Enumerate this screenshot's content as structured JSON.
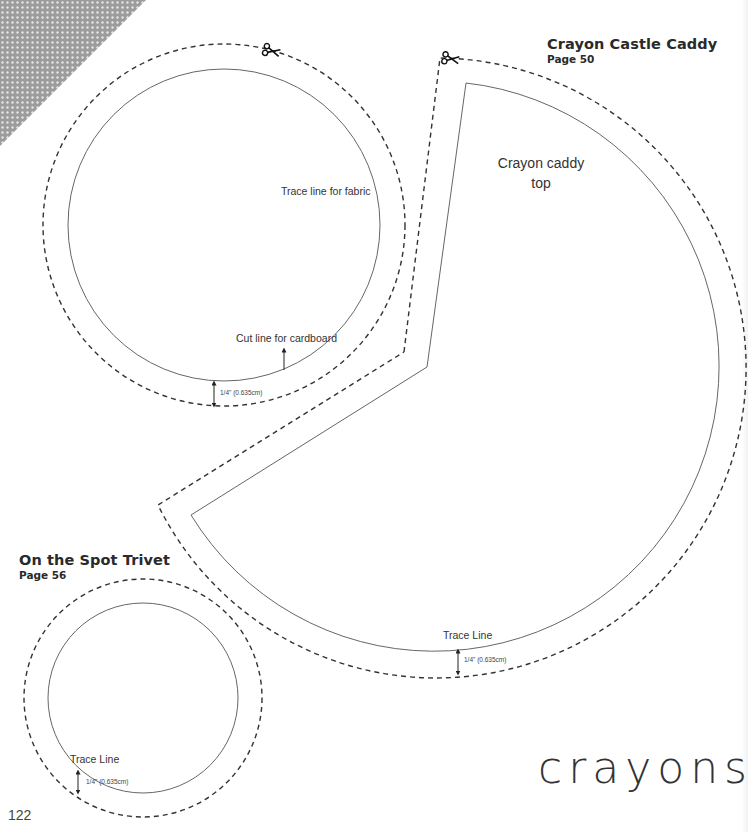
{
  "headings": {
    "caddy_title": "Crayon Castle Caddy",
    "caddy_page": "Page 50",
    "trivet_title": "On the Spot Trivet",
    "trivet_page": "Page 56"
  },
  "labels": {
    "trace_fabric": "Trace line for fabric",
    "cut_cardboard": "Cut line for cardboard",
    "caddy_top_line1": "Crayon caddy",
    "caddy_top_line2": "top",
    "trace_line_caddy": "Trace Line",
    "trace_line_trivet": "Trace Line"
  },
  "measurements": {
    "seam_circle": "1/4\" (0.635cm)",
    "seam_caddy": "1/4\" (0.635cm)",
    "seam_trivet": "1/4\" (0.635cm)"
  },
  "footer": {
    "page_number": "122",
    "brand_wordmark": "crayons"
  },
  "icons": {
    "scissors_1": "scissors-icon",
    "scissors_2": "scissors-icon"
  },
  "colors": {
    "line": "#3a3a3a",
    "dot_pattern_bg": "#9a9a9a",
    "dot_pattern_dot": "#e8e8e8",
    "text": "#2a2a2a"
  }
}
